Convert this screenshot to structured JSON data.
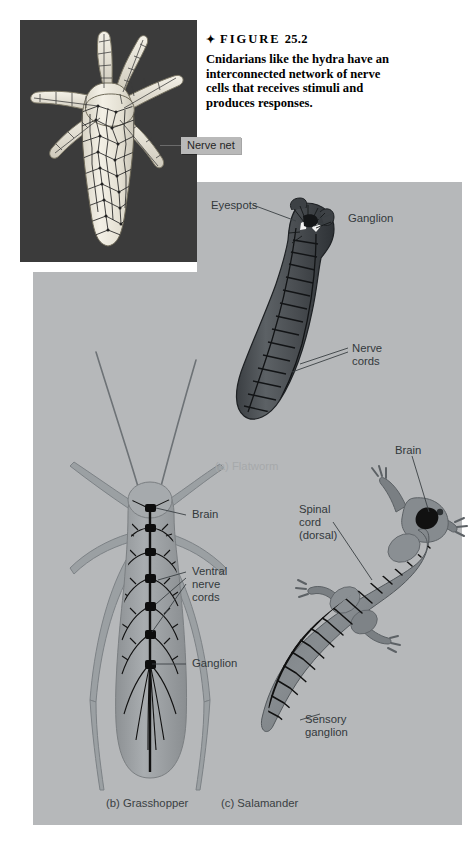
{
  "figure": {
    "diamond": "✦",
    "title_word": "FIGURE",
    "number": "25.2",
    "caption": "Cnidarians like the hydra have an interconnected network of nerve cells that receives stimuli and produces responses."
  },
  "hydra_panel": {
    "callout_label": "Nerve net",
    "background_color": "#3b3b3b",
    "body_color": "#ece9df",
    "net_color": "#2a2a2a"
  },
  "gray_panel": {
    "background_color": "#b6b8ba"
  },
  "flatworm": {
    "subcaption": "(a) Flatworm",
    "labels": [
      {
        "text": "Eyespots",
        "name": "label-eyespots"
      },
      {
        "text": "Ganglion",
        "name": "label-ganglion-flatworm"
      },
      {
        "text": "Nerve\ncords",
        "name": "label-nerve-cords"
      }
    ],
    "body_color": "#4a4e52"
  },
  "grasshopper": {
    "subcaption": "(b) Grasshopper",
    "labels": [
      {
        "text": "Brain",
        "name": "label-brain-grasshopper"
      },
      {
        "text": "Ventral\nnerve\ncords",
        "name": "label-ventral-nerve-cords"
      },
      {
        "text": "Ganglion",
        "name": "label-ganglion-grasshopper"
      }
    ],
    "body_color": "#9a9ea1",
    "nerve_color": "#1b1b1b"
  },
  "salamander": {
    "subcaption": "(c) Salamander",
    "labels": [
      {
        "text": "Brain",
        "name": "label-brain-salamander"
      },
      {
        "text": "Spinal\ncord\n(dorsal)",
        "name": "label-spinal-cord"
      },
      {
        "text": "Sensory\nganglion",
        "name": "label-sensory-ganglion"
      }
    ],
    "body_color": "#7d8286",
    "nerve_color": "#151515"
  }
}
